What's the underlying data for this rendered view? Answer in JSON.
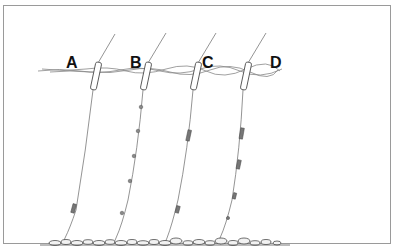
{
  "diagram": {
    "type": "fishing-float-rig-illustration",
    "rigs": [
      {
        "label": "A",
        "shot_pattern": "single bulk group near hook"
      },
      {
        "label": "B",
        "shot_pattern": "evenly spaced single shots"
      },
      {
        "label": "C",
        "shot_pattern": "two bulk groups (upper and lower)"
      },
      {
        "label": "D",
        "shot_pattern": "graduated groups, larger above, smaller toward hook"
      }
    ],
    "elements": [
      "water-surface",
      "rod-tip-lines",
      "floats",
      "shot",
      "hooks",
      "riverbed-stones"
    ],
    "colors": {
      "line": "#555555",
      "frame": "#9a9a9a",
      "label": "#111111"
    }
  }
}
